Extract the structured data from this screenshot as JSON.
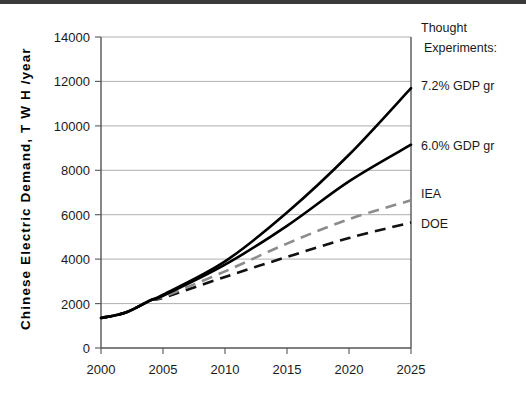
{
  "chart_data": {
    "type": "line",
    "title": "",
    "xlabel": "",
    "ylabel": "Chinese Electric Demand, T W H /year",
    "xlim": [
      2000,
      2025
    ],
    "ylim": [
      0,
      14000
    ],
    "grid": true,
    "legend_position": "right-annotations",
    "xticks": [
      "2000",
      "2005",
      "2010",
      "2015",
      "2020",
      "2025"
    ],
    "yticks": [
      "0",
      "2000",
      "4000",
      "6000",
      "8000",
      "10000",
      "12000",
      "14000"
    ],
    "x": [
      2000,
      2002,
      2004,
      2005,
      2010,
      2015,
      2020,
      2025
    ],
    "series": [
      {
        "name": "7.2% GDP gr",
        "style": "solid",
        "color": "#000000",
        "values": [
          1350,
          1600,
          2150,
          2400,
          3900,
          6100,
          8700,
          11700
        ]
      },
      {
        "name": "6.0% GDP gr",
        "style": "solid",
        "color": "#000000",
        "values": [
          1350,
          1600,
          2150,
          2350,
          3750,
          5500,
          7500,
          9150
        ]
      },
      {
        "name": "IEA",
        "style": "dashed",
        "color": "#8c8c8c",
        "values": [
          1350,
          1600,
          2150,
          2300,
          3450,
          4700,
          5800,
          6650
        ]
      },
      {
        "name": "DOE",
        "style": "dashed",
        "color": "#111111",
        "values": [
          1350,
          1600,
          2150,
          2250,
          3200,
          4100,
          4950,
          5650
        ]
      }
    ],
    "annotations": [
      {
        "name": "thought-experiments-heading-line1",
        "text": "Thought"
      },
      {
        "name": "thought-experiments-heading-line2",
        "text": "Experiments:"
      },
      {
        "name": "series-label-7-2-gdp",
        "text": "7.2% GDP gr"
      },
      {
        "name": "series-label-6-0-gdp",
        "text": "6.0% GDP gr"
      },
      {
        "name": "series-label-iea",
        "text": "IEA"
      },
      {
        "name": "series-label-doe",
        "text": "DOE"
      }
    ]
  }
}
